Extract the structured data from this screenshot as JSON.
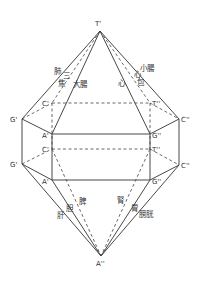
{
  "diagram": {
    "type": "hexagonal-bipyramid-prism",
    "vertices": {
      "top_apex": "T'",
      "bottom_apex": "A''",
      "upper_left_outer": "G'",
      "lower_left_outer": "G'",
      "upper_left_back": "C'",
      "lower_left_back": "C'",
      "upper_left_front": "A'",
      "lower_left_front": "A'",
      "upper_right_front": "G''",
      "lower_right_front": "G''",
      "upper_right_back": "T''",
      "lower_right_back": "T''",
      "upper_right_outer": "C''",
      "lower_right_outer": "C''"
    },
    "upper_labels": {
      "lung": "肺",
      "triple_burner": "三焦",
      "large_intestine": "大腸",
      "small_intestine": "小腸",
      "pericardium": "心包",
      "heart": "心"
    },
    "lower_labels": {
      "liver": "肝",
      "gallbladder": "胆",
      "spleen": "脾",
      "kidney": "腎",
      "stomach": "胃",
      "bladder": "膀胱"
    },
    "colors": {
      "line": "#333333",
      "background": "#ffffff"
    }
  }
}
